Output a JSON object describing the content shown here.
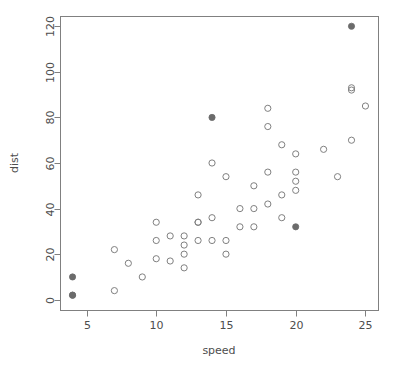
{
  "chart_data": {
    "type": "scatter",
    "title": "",
    "xlabel": "speed",
    "ylabel": "dist",
    "xlim": [
      3.1,
      25.9
    ],
    "ylim": [
      -4.5,
      124.5
    ],
    "xticks": [
      5,
      10,
      15,
      20,
      25
    ],
    "yticks": [
      0,
      20,
      40,
      60,
      80,
      100,
      120
    ],
    "grid": false,
    "legend": null,
    "series": [
      {
        "name": "open",
        "marker": "open-circle",
        "color": "#808080",
        "points": [
          {
            "x": 4,
            "y": 2
          },
          {
            "x": 7,
            "y": 4
          },
          {
            "x": 7,
            "y": 22
          },
          {
            "x": 8,
            "y": 16
          },
          {
            "x": 9,
            "y": 10
          },
          {
            "x": 10,
            "y": 18
          },
          {
            "x": 10,
            "y": 26
          },
          {
            "x": 10,
            "y": 34
          },
          {
            "x": 11,
            "y": 17
          },
          {
            "x": 11,
            "y": 28
          },
          {
            "x": 12,
            "y": 14
          },
          {
            "x": 12,
            "y": 20
          },
          {
            "x": 12,
            "y": 24
          },
          {
            "x": 12,
            "y": 28
          },
          {
            "x": 13,
            "y": 26
          },
          {
            "x": 13,
            "y": 34
          },
          {
            "x": 13,
            "y": 34
          },
          {
            "x": 13,
            "y": 46
          },
          {
            "x": 14,
            "y": 26
          },
          {
            "x": 14,
            "y": 36
          },
          {
            "x": 14,
            "y": 60
          },
          {
            "x": 15,
            "y": 20
          },
          {
            "x": 15,
            "y": 26
          },
          {
            "x": 15,
            "y": 54
          },
          {
            "x": 16,
            "y": 32
          },
          {
            "x": 16,
            "y": 40
          },
          {
            "x": 17,
            "y": 32
          },
          {
            "x": 17,
            "y": 40
          },
          {
            "x": 17,
            "y": 50
          },
          {
            "x": 18,
            "y": 42
          },
          {
            "x": 18,
            "y": 56
          },
          {
            "x": 18,
            "y": 76
          },
          {
            "x": 18,
            "y": 84
          },
          {
            "x": 19,
            "y": 36
          },
          {
            "x": 19,
            "y": 46
          },
          {
            "x": 19,
            "y": 68
          },
          {
            "x": 20,
            "y": 48
          },
          {
            "x": 20,
            "y": 52
          },
          {
            "x": 20,
            "y": 56
          },
          {
            "x": 20,
            "y": 64
          },
          {
            "x": 22,
            "y": 66
          },
          {
            "x": 23,
            "y": 54
          },
          {
            "x": 24,
            "y": 70
          },
          {
            "x": 24,
            "y": 92
          },
          {
            "x": 24,
            "y": 93
          },
          {
            "x": 25,
            "y": 85
          }
        ]
      },
      {
        "name": "highlighted",
        "marker": "filled-circle",
        "color": "#6b6b6b",
        "points": [
          {
            "x": 4,
            "y": 2
          },
          {
            "x": 4,
            "y": 10
          },
          {
            "x": 14,
            "y": 80
          },
          {
            "x": 20,
            "y": 32
          },
          {
            "x": 24,
            "y": 120
          }
        ]
      }
    ]
  },
  "axes": {
    "x_tick_labels": [
      "5",
      "10",
      "15",
      "20",
      "25"
    ],
    "y_tick_labels": [
      "0",
      "20",
      "40",
      "60",
      "80",
      "100",
      "120"
    ],
    "x_axis_title": "speed",
    "y_axis_title": "dist"
  },
  "style": {
    "frame_color": "#808080",
    "text_color": "#4d4d4d",
    "open_marker_color": "#808080",
    "filled_marker_color": "#6b6b6b",
    "background": "#ffffff"
  },
  "geometry": {
    "plot_left": 60,
    "plot_right": 378,
    "plot_top": 16,
    "plot_bottom": 310
  }
}
